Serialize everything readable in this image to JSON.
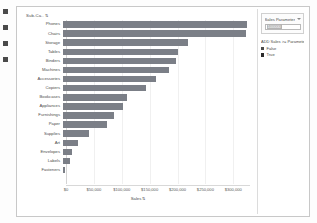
{
  "gutter": {
    "marks": 4
  },
  "sheet": {
    "title": "Sub-Ca..",
    "sort_glyph": "⇅",
    "axis_title": "Sales",
    "axis_sort_glyph": "⇅"
  },
  "panel": {
    "parameter": {
      "title": "Sales Parameter",
      "value": "100000",
      "caret_icon": "chevron-down-icon"
    },
    "legend": {
      "title": "ADD Sales >= Parameter",
      "items": [
        {
          "label": "False",
          "color": "#4a4a4a"
        },
        {
          "label": "True",
          "color": "#2b2b2b"
        }
      ]
    }
  },
  "chart_data": {
    "type": "bar",
    "orientation": "horizontal",
    "title": "Sub-Ca..",
    "xlabel": "Sales",
    "ylabel": "Sub-Category",
    "xlim": [
      0,
      330000
    ],
    "grid": true,
    "legend_position": "right",
    "bar_color": "#7b7f87",
    "tick_labels": [
      "$0",
      "$50,000",
      "$100,000",
      "$150,000",
      "$200,000",
      "$250,000",
      "$300,000"
    ],
    "tick_values": [
      0,
      50000,
      100000,
      150000,
      200000,
      250000,
      300000
    ],
    "categories": [
      "Phones",
      "Chairs",
      "Storage",
      "Tables",
      "Binders",
      "Machines",
      "Accessories",
      "Copiers",
      "Bookcases",
      "Appliances",
      "Furnishings",
      "Paper",
      "Supplies",
      "Art",
      "Envelopes",
      "Labels",
      "Fasteners"
    ],
    "values": [
      330007,
      328449,
      223844,
      206966,
      203413,
      189239,
      167380,
      149528,
      114880,
      107532,
      91705,
      78479,
      46674,
      27119,
      16476,
      12486,
      3024
    ]
  }
}
